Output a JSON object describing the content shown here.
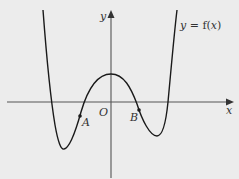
{
  "figure": {
    "curve_label": "y = f(x)",
    "axes": {
      "x_label": "x",
      "y_label": "y",
      "origin_label": "O"
    },
    "points": [
      {
        "label": "A",
        "description": "point on curve between left root and origin, below x-axis"
      },
      {
        "label": "B",
        "description": "point on curve just right of origin root, below x-axis"
      }
    ],
    "colors": {
      "background": "#ececec",
      "curve": "#1a1a1a",
      "axes": "#555555",
      "text": "#333333"
    }
  }
}
